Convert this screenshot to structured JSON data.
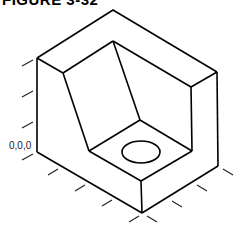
{
  "figure": {
    "title": "FIGURE 3-32",
    "origin_label": "0,0,0",
    "line_color": "#000000",
    "tick_color": "#222222"
  },
  "drawing": {
    "type": "isometric-block",
    "features": [
      "stepped block",
      "sloped face",
      "hole on step top"
    ]
  }
}
